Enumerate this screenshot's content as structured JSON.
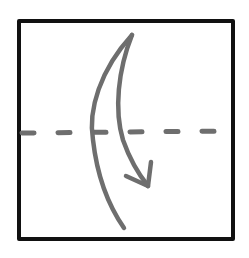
{
  "diagram": {
    "title": "Valley fold in half, top to bottom",
    "type": "origami-fold-instruction",
    "colors": {
      "background": "#ffffff",
      "paper_border": "#111111",
      "fold_line": "#6e6e6e",
      "arrow": "#6e6e6e"
    },
    "paper": {
      "shape": "square",
      "x": 18,
      "y": 20,
      "width": 216,
      "height": 220,
      "border_width": 4
    },
    "fold_line": {
      "style": "dashed",
      "kind": "valley-fold",
      "y": 132,
      "x_start": 20,
      "x_end": 230,
      "dash_length": 14,
      "gap_length": 22
    },
    "arrow": {
      "direction": "down",
      "meaning": "fold top edge down to bottom edge",
      "start": [
        132,
        34
      ],
      "tip": [
        148,
        187
      ]
    }
  }
}
